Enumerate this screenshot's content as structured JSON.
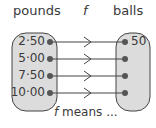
{
  "header": {
    "domain_label": "pounds",
    "function_label": "f",
    "codomain_label": "balls"
  },
  "mapping": {
    "domain_values": [
      "2·50",
      "5·00",
      "7·50",
      "10·00"
    ],
    "codomain_values": [
      "50",
      "",
      "",
      ""
    ]
  },
  "caption": {
    "italic": "f",
    "text": " means ..."
  },
  "colors": {
    "oval_fill": "#dcdcdc",
    "stroke": "#444444",
    "text": "#3a3a3a"
  }
}
